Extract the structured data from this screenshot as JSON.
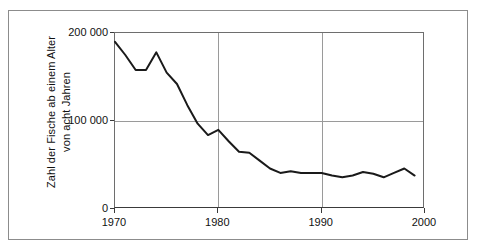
{
  "chart_data": {
    "type": "line",
    "title": "",
    "xlabel": "",
    "ylabel": "Zahl der Fische ab einem Alter von acht Jahren",
    "ylabel_lines": [
      "Zahl der Fische ab einem Alter",
      "von acht Jahren"
    ],
    "xlim": [
      1970,
      2000
    ],
    "ylim": [
      0,
      200000
    ],
    "grid": true,
    "legend": "none",
    "y_ticks": [
      0,
      100000,
      200000
    ],
    "y_tick_labels": [
      "0",
      "100 000",
      "200 000"
    ],
    "x_ticks": [
      1970,
      1980,
      1990,
      2000
    ],
    "x_tick_labels": [
      "1970",
      "1980",
      "1990",
      "2000"
    ],
    "x": [
      1970,
      1971,
      1972,
      1973,
      1974,
      1975,
      1976,
      1977,
      1978,
      1979,
      1980,
      1981,
      1982,
      1983,
      1984,
      1985,
      1986,
      1987,
      1988,
      1989,
      1990,
      1991,
      1992,
      1993,
      1994,
      1995,
      1996,
      1997,
      1998,
      1999
    ],
    "values": [
      190000,
      175000,
      158000,
      158000,
      178000,
      155000,
      142000,
      118000,
      97000,
      84000,
      90000,
      77000,
      65000,
      64000,
      55000,
      46000,
      41000,
      43000,
      41000,
      41000,
      41000,
      38000,
      36000,
      38000,
      42000,
      40000,
      36000,
      41000,
      46000,
      38000
    ],
    "series_name": "Zahl der Fische ab einem Alter von acht Jahren",
    "line_color": "#1a1a1a",
    "grid_color": "#9a9a9a",
    "axis_color": "#3a3a3a",
    "background_color": "#ffffff"
  }
}
